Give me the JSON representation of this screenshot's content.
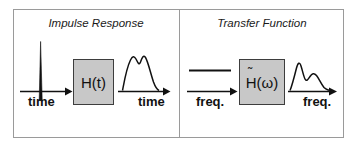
{
  "figure": {
    "type": "signal-processing-block-diagram",
    "frame_color": "#9a9a9a",
    "box_fill": "#c8c8c8",
    "box_border": "#3d3d3d",
    "line_color": "#111111"
  },
  "panels": [
    {
      "id": "impulse-response",
      "title": "Impulse Response",
      "input_signal": "impulse-spike",
      "input_axis_label": "time",
      "system_label": "H(t)",
      "output_signal": "double-hump-waveform",
      "output_axis_label": "time"
    },
    {
      "id": "transfer-function",
      "title": "Transfer Function",
      "input_signal": "flat-line",
      "input_axis_label": "freq.",
      "system_label": "H̃(ω)",
      "system_label_base": "H",
      "system_label_tilde": "˜",
      "system_label_arg": "(ω)",
      "output_signal": "peak-decay-waveform",
      "output_axis_label": "freq."
    }
  ],
  "icons": {
    "arrow_right": "arrow-right-icon",
    "impulse": "impulse-spike-icon",
    "flat_line": "flat-line-icon",
    "waveform_double_hump": "waveform-double-hump-icon",
    "waveform_peak_decay": "waveform-peak-decay-icon"
  }
}
